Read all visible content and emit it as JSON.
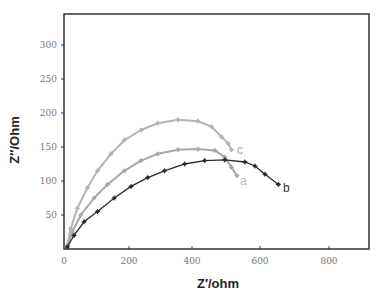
{
  "chart_data": {
    "type": "scatter",
    "title": "",
    "xlabel": "Z′/ohm",
    "ylabel": "Z″/Ohm",
    "xlim": [
      0,
      910
    ],
    "ylim": [
      0,
      345
    ],
    "xticks": [
      0,
      200,
      400,
      600,
      800
    ],
    "yticks": [
      50,
      100,
      150,
      200,
      250,
      300
    ],
    "grid": false,
    "legend": "inline labels at curve ends",
    "series": [
      {
        "name": "c",
        "color": "#b4b4b4",
        "marker": "diamond",
        "x": [
          10,
          20,
          40,
          70,
          100,
          140,
          180,
          230,
          280,
          340,
          400,
          440,
          470,
          490,
          500
        ],
        "y": [
          5,
          30,
          60,
          90,
          115,
          140,
          160,
          175,
          185,
          190,
          188,
          180,
          165,
          155,
          146
        ]
      },
      {
        "name": "a",
        "color": "#a8a8a8",
        "marker": "diamond",
        "x": [
          10,
          25,
          50,
          90,
          130,
          180,
          230,
          280,
          340,
          400,
          450,
          480,
          500,
          516
        ],
        "y": [
          5,
          25,
          50,
          75,
          95,
          115,
          130,
          140,
          146,
          147,
          145,
          135,
          120,
          108
        ]
      },
      {
        "name": "b",
        "color": "#2a2a2a",
        "marker": "cross",
        "x": [
          10,
          30,
          60,
          100,
          150,
          200,
          250,
          300,
          360,
          420,
          480,
          540,
          570,
          600,
          640
        ],
        "y": [
          3,
          20,
          40,
          55,
          75,
          92,
          105,
          115,
          125,
          130,
          131,
          128,
          122,
          110,
          95
        ]
      }
    ]
  },
  "labels": {
    "xlabel": "Z′/ohm",
    "ylabel": "Z″/Ohm",
    "series_c": "c",
    "series_a": "a",
    "series_b": "b",
    "xtick_0": "0",
    "xtick_200": "200",
    "xtick_400": "400",
    "xtick_600": "600",
    "xtick_800": "800",
    "ytick_50": "50",
    "ytick_100": "100",
    "ytick_150": "150",
    "ytick_200": "200",
    "ytick_250": "250",
    "ytick_300": "300"
  }
}
